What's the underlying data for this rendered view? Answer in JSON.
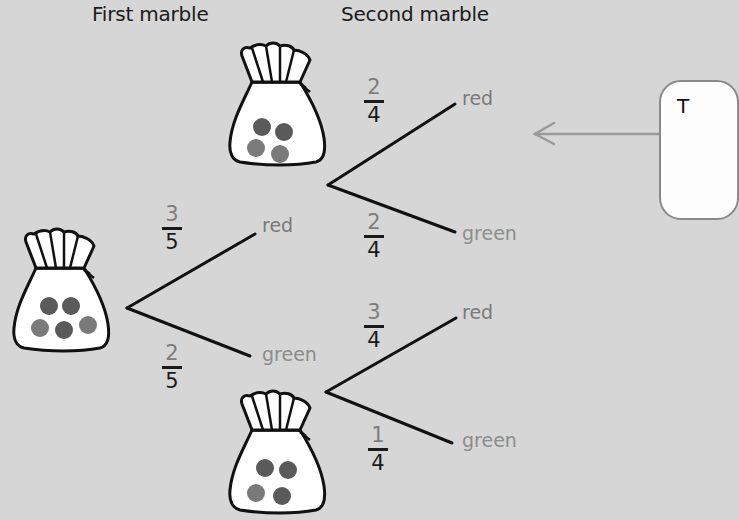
{
  "headers": {
    "first": "First marble",
    "second": "Second marble"
  },
  "colors": {
    "background": "#d6d6d6",
    "line": "#111111",
    "red_marble": "#5a5a5a",
    "green_marble": "#7a7a7a",
    "red_label": "#7a7a7a",
    "green_label": "#8c8c8c",
    "arrow": "#9a9a9a",
    "callout_border": "#8a8a8a"
  },
  "first_bag": {
    "marbles": [
      "red",
      "red",
      "green",
      "red",
      "green"
    ],
    "count_red": 3,
    "count_green": 2
  },
  "first_level": {
    "red": {
      "label": "red",
      "numerator": "3",
      "denominator": "5"
    },
    "green": {
      "label": "green",
      "numerator": "2",
      "denominator": "5"
    }
  },
  "after_red_bag": {
    "marbles": [
      "red",
      "red",
      "green",
      "green"
    ],
    "count_red": 2,
    "count_green": 2
  },
  "after_green_bag": {
    "marbles": [
      "red",
      "red",
      "green",
      "red"
    ],
    "count_red": 3,
    "count_green": 1
  },
  "second_level": {
    "after_red": {
      "red": {
        "label": "red",
        "numerator": "2",
        "denominator": "4"
      },
      "green": {
        "label": "green",
        "numerator": "2",
        "denominator": "4"
      }
    },
    "after_green": {
      "red": {
        "label": "red",
        "numerator": "3",
        "denominator": "4"
      },
      "green": {
        "label": "green",
        "numerator": "1",
        "denominator": "4"
      }
    }
  },
  "callout": {
    "text": "T",
    "arrow_direction": "left"
  }
}
